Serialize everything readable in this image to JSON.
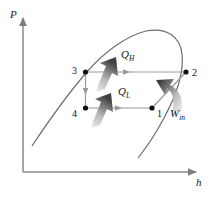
{
  "figure": {
    "type": "thermodynamic-cycle-diagram",
    "axes": {
      "y_label": "P",
      "x_label": "h",
      "y_axis_name": "pressure-axis",
      "x_axis_name": "enthalpy-axis"
    },
    "states": [
      {
        "id": "1",
        "label": "1",
        "x": 152,
        "y": 108,
        "label_x": 157,
        "label_y": 117
      },
      {
        "id": "2",
        "label": "2",
        "x": 186,
        "y": 72,
        "label_x": 192,
        "label_y": 76
      },
      {
        "id": "3",
        "label": "3",
        "x": 85,
        "y": 72,
        "label_x": 72,
        "label_y": 74
      },
      {
        "id": "4",
        "label": "4",
        "x": 85,
        "y": 108,
        "label_x": 72,
        "label_y": 117
      }
    ],
    "energy_flows": [
      {
        "id": "qh",
        "symbol": "Q",
        "subscript": "H",
        "label_x": 121,
        "label_y": 58,
        "meaning": "heat rejected in condenser"
      },
      {
        "id": "ql",
        "symbol": "Q",
        "subscript": "L",
        "label_x": 118,
        "label_y": 95,
        "meaning": "heat absorbed in evaporator"
      },
      {
        "id": "win",
        "symbol": "W",
        "subscript": "in",
        "label_x": 172,
        "label_y": 116,
        "meaning": "compressor work input"
      }
    ],
    "processes": [
      {
        "from": "2",
        "to": "3",
        "name": "condensation",
        "direction": "leftward"
      },
      {
        "from": "3",
        "to": "4",
        "name": "expansion",
        "direction": "downward"
      },
      {
        "from": "4",
        "to": "1",
        "name": "evaporation",
        "direction": "rightward"
      },
      {
        "from": "1",
        "to": "2",
        "name": "compression",
        "direction": "up-right"
      }
    ],
    "saturation_dome": "vapor-dome",
    "colors": {
      "axis": "#8a8a8a",
      "curve": "#6b6b6b",
      "process_line": "#8f8f8f",
      "marker": "#111111",
      "arrow_dark": "#4a4a4a",
      "arrow_light": "#d9d9d9",
      "text": "#111111"
    }
  }
}
